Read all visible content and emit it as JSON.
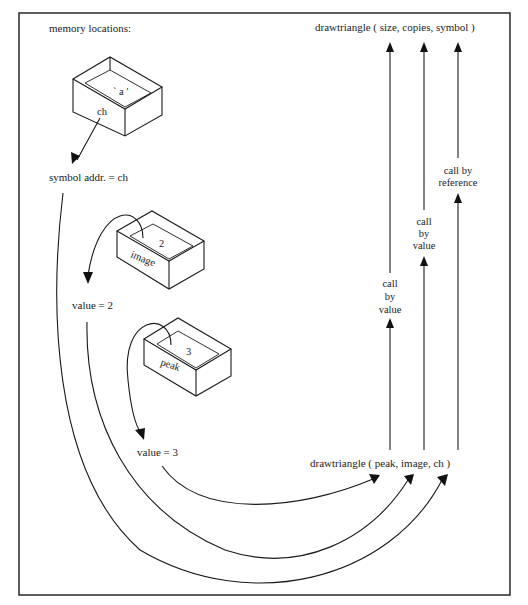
{
  "diagram": {
    "title": "memory locations:",
    "boxes": [
      {
        "name": "ch",
        "content": "` a '",
        "label": "ch"
      },
      {
        "name": "image",
        "content": "2",
        "label": "image"
      },
      {
        "name": "peak",
        "content": "3",
        "label": "peak"
      }
    ],
    "values": {
      "symbol": "symbol addr. = ch",
      "image": "value = 2",
      "peak": "value = 3"
    },
    "function_definition": "drawtriangle ( size, copies, symbol )",
    "function_call": "drawtriangle ( peak, image, ch )",
    "call_labels": [
      {
        "param": "size",
        "lines": [
          "call",
          "by",
          "value"
        ]
      },
      {
        "param": "copies",
        "lines": [
          "call",
          "by",
          "value"
        ]
      },
      {
        "param": "symbol",
        "lines": [
          "call by",
          "reference"
        ]
      }
    ]
  }
}
